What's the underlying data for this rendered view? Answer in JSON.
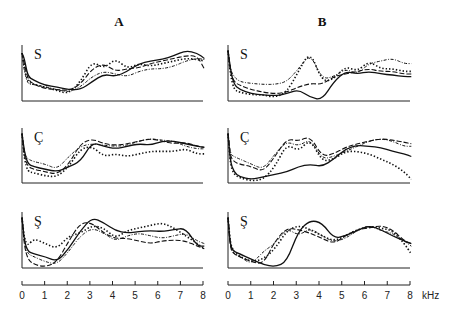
{
  "chart_data": {
    "type": "line",
    "title": "",
    "xlabel": "kHz",
    "ylabel": "",
    "xlim": [
      0,
      8
    ],
    "x_ticks": [
      "0",
      "1",
      "2",
      "3",
      "4",
      "5",
      "6",
      "7",
      "8"
    ],
    "x_unit": "kHz",
    "grid": false,
    "legend": "none",
    "columns": [
      "A",
      "B"
    ],
    "rows": [
      "S",
      "Ç",
      "Ş"
    ],
    "series_styles": [
      "solid",
      "dashed",
      "dotted",
      "dash-dot"
    ],
    "x": [
      0,
      0.1,
      0.25,
      0.5,
      1,
      1.5,
      2,
      2.5,
      3,
      3.5,
      4,
      4.5,
      5,
      5.5,
      6,
      6.5,
      7,
      7.5,
      7.8
    ],
    "panels": [
      {
        "column": "A",
        "row": "S",
        "label": "S",
        "series": [
          {
            "name": "solid",
            "values": [
              0.9,
              0.8,
              0.45,
              0.38,
              0.28,
              0.25,
              0.2,
              0.2,
              0.35,
              0.5,
              0.45,
              0.55,
              0.7,
              0.75,
              0.78,
              0.85,
              0.95,
              0.9,
              0.8
            ]
          },
          {
            "name": "dashed",
            "values": [
              0.9,
              0.7,
              0.4,
              0.3,
              0.22,
              0.2,
              0.18,
              0.3,
              0.6,
              0.7,
              0.55,
              0.6,
              0.62,
              0.7,
              0.75,
              0.8,
              0.85,
              0.85,
              0.6
            ]
          },
          {
            "name": "dotted",
            "values": [
              0.9,
              0.6,
              0.35,
              0.3,
              0.25,
              0.18,
              0.12,
              0.35,
              0.75,
              0.6,
              0.8,
              0.6,
              0.7,
              0.65,
              0.7,
              0.75,
              0.8,
              0.78,
              0.75
            ]
          },
          {
            "name": "dash-dot",
            "values": [
              0.9,
              0.55,
              0.3,
              0.3,
              0.25,
              0.2,
              0.15,
              0.25,
              0.45,
              0.55,
              0.5,
              0.45,
              0.55,
              0.6,
              0.6,
              0.65,
              0.75,
              0.8,
              0.78
            ]
          }
        ]
      },
      {
        "column": "B",
        "row": "S",
        "label": "S",
        "series": [
          {
            "name": "solid",
            "values": [
              0.95,
              0.6,
              0.3,
              0.2,
              0.12,
              0.1,
              0.08,
              0.12,
              0.2,
              0.05,
              0.0,
              0.35,
              0.55,
              0.5,
              0.55,
              0.5,
              0.48,
              0.45,
              0.45
            ]
          },
          {
            "name": "dashed",
            "values": [
              0.95,
              0.55,
              0.35,
              0.28,
              0.2,
              0.15,
              0.12,
              0.15,
              0.25,
              0.32,
              0.3,
              0.45,
              0.5,
              0.55,
              0.6,
              0.55,
              0.55,
              0.5,
              0.5
            ]
          },
          {
            "name": "dotted",
            "values": [
              0.95,
              0.5,
              0.2,
              0.15,
              0.1,
              0.1,
              0.05,
              0.15,
              0.55,
              0.95,
              0.35,
              0.4,
              0.65,
              0.55,
              0.75,
              0.6,
              0.6,
              0.55,
              0.55
            ]
          },
          {
            "name": "dash-dot",
            "values": [
              0.95,
              0.6,
              0.45,
              0.35,
              0.32,
              0.3,
              0.3,
              0.35,
              0.6,
              0.9,
              0.4,
              0.45,
              0.6,
              0.5,
              0.7,
              0.75,
              0.8,
              0.7,
              0.7
            ]
          }
        ]
      },
      {
        "column": "A",
        "row": "Ç",
        "label": "Ç",
        "series": [
          {
            "name": "solid",
            "values": [
              0.95,
              0.6,
              0.35,
              0.3,
              0.25,
              0.2,
              0.3,
              0.4,
              0.78,
              0.7,
              0.65,
              0.7,
              0.75,
              0.72,
              0.8,
              0.8,
              0.75,
              0.7,
              0.68
            ]
          },
          {
            "name": "dashed",
            "values": [
              0.95,
              0.5,
              0.3,
              0.25,
              0.2,
              0.15,
              0.35,
              0.75,
              0.85,
              0.75,
              0.72,
              0.75,
              0.8,
              0.85,
              0.8,
              0.75,
              0.78,
              0.7,
              0.68
            ]
          },
          {
            "name": "dotted",
            "values": [
              0.95,
              0.45,
              0.2,
              0.18,
              0.12,
              0.1,
              0.3,
              0.65,
              0.7,
              0.5,
              0.55,
              0.5,
              0.55,
              0.6,
              0.6,
              0.6,
              0.65,
              0.55,
              0.55
            ]
          },
          {
            "name": "dash-dot",
            "values": [
              0.95,
              0.55,
              0.45,
              0.4,
              0.35,
              0.25,
              0.5,
              0.7,
              0.75,
              0.72,
              0.7,
              0.72,
              0.8,
              0.85,
              0.82,
              0.8,
              0.7,
              0.65,
              0.65
            ]
          }
        ]
      },
      {
        "column": "B",
        "row": "Ç",
        "label": "Ç",
        "series": [
          {
            "name": "solid",
            "values": [
              0.95,
              0.4,
              0.2,
              0.1,
              0.05,
              0.1,
              0.15,
              0.2,
              0.3,
              0.35,
              0.3,
              0.45,
              0.65,
              0.72,
              0.7,
              0.68,
              0.6,
              0.55,
              0.5
            ]
          },
          {
            "name": "dashed",
            "values": [
              0.95,
              0.5,
              0.4,
              0.35,
              0.3,
              0.2,
              0.5,
              0.85,
              0.8,
              0.9,
              0.5,
              0.55,
              0.68,
              0.75,
              0.8,
              0.85,
              0.82,
              0.78,
              0.75
            ]
          },
          {
            "name": "dotted",
            "values": [
              0.95,
              0.35,
              0.15,
              0.08,
              0.02,
              0.05,
              0.3,
              0.75,
              0.6,
              0.85,
              0.4,
              0.45,
              0.6,
              0.6,
              0.55,
              0.45,
              0.35,
              0.2,
              0.05
            ]
          },
          {
            "name": "dash-dot",
            "values": [
              0.95,
              0.55,
              0.5,
              0.45,
              0.35,
              0.25,
              0.55,
              0.8,
              0.7,
              0.85,
              0.45,
              0.5,
              0.6,
              0.7,
              0.8,
              0.85,
              0.8,
              0.7,
              0.7
            ]
          }
        ]
      },
      {
        "column": "A",
        "row": "Ş",
        "label": "Ş",
        "series": [
          {
            "name": "solid",
            "values": [
              0.95,
              0.5,
              0.3,
              0.25,
              0.2,
              0.1,
              0.35,
              0.7,
              0.95,
              0.85,
              0.7,
              0.65,
              0.68,
              0.7,
              0.68,
              0.72,
              0.75,
              0.4,
              0.4
            ]
          },
          {
            "name": "dashed",
            "values": [
              0.95,
              0.4,
              0.15,
              0.05,
              0.0,
              0.1,
              0.5,
              0.85,
              0.85,
              0.65,
              0.55,
              0.55,
              0.5,
              0.45,
              0.5,
              0.52,
              0.5,
              0.4,
              0.35
            ]
          },
          {
            "name": "dotted",
            "values": [
              0.95,
              0.55,
              0.4,
              0.55,
              0.45,
              0.35,
              0.6,
              0.65,
              0.8,
              0.75,
              0.55,
              0.7,
              0.75,
              0.8,
              0.85,
              0.75,
              0.6,
              0.45,
              0.35
            ]
          },
          {
            "name": "dash-dot",
            "values": [
              0.95,
              0.45,
              0.25,
              0.2,
              0.1,
              0.05,
              0.3,
              0.6,
              0.75,
              0.65,
              0.5,
              0.6,
              0.65,
              0.6,
              0.55,
              0.6,
              0.65,
              0.5,
              0.45
            ]
          }
        ]
      },
      {
        "column": "B",
        "row": "Ş",
        "label": "Ş",
        "series": [
          {
            "name": "solid",
            "values": [
              0.95,
              0.4,
              0.3,
              0.25,
              0.15,
              0.05,
              0.0,
              0.1,
              0.7,
              0.9,
              0.85,
              0.55,
              0.6,
              0.7,
              0.8,
              0.72,
              0.6,
              0.5,
              0.45
            ]
          },
          {
            "name": "dashed",
            "values": [
              0.95,
              0.35,
              0.25,
              0.2,
              0.1,
              0.05,
              0.5,
              0.75,
              0.72,
              0.65,
              0.55,
              0.45,
              0.6,
              0.72,
              0.75,
              0.8,
              0.72,
              0.5,
              0.45
            ]
          },
          {
            "name": "dotted",
            "values": [
              0.95,
              0.45,
              0.3,
              0.2,
              0.1,
              0.15,
              0.35,
              0.7,
              0.8,
              0.72,
              0.6,
              0.5,
              0.6,
              0.72,
              0.78,
              0.75,
              0.7,
              0.45,
              0.25
            ]
          },
          {
            "name": "dash-dot",
            "values": [
              0.95,
              0.4,
              0.25,
              0.2,
              0.05,
              0.3,
              0.45,
              0.75,
              0.6,
              0.75,
              0.6,
              0.48,
              0.55,
              0.7,
              0.8,
              0.7,
              0.65,
              0.5,
              0.4
            ]
          }
        ]
      }
    ]
  },
  "labels": {
    "col_a": "A",
    "col_b": "B",
    "row_1": "S",
    "row_2": "Ç",
    "row_3": "Ş",
    "unit": "kHz"
  }
}
